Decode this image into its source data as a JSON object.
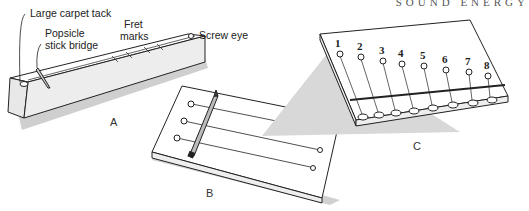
{
  "header": {
    "running_head": "SOUND ENERGY"
  },
  "figure_a": {
    "caption": "A",
    "labels": {
      "tack": "Large carpet tack",
      "bridge_line1": "Popsicle",
      "bridge_line2": "stick bridge",
      "fret_line1": "Fret",
      "fret_line2": "marks",
      "screw_eye": "Screw eye"
    }
  },
  "figure_b": {
    "caption": "B"
  },
  "figure_c": {
    "caption": "C",
    "string_numbers": [
      "1",
      "2",
      "3",
      "4",
      "5",
      "6",
      "7",
      "8"
    ]
  },
  "colors": {
    "ink": "#222222",
    "shadow": "#c8c8c8",
    "paper": "#ffffff"
  }
}
